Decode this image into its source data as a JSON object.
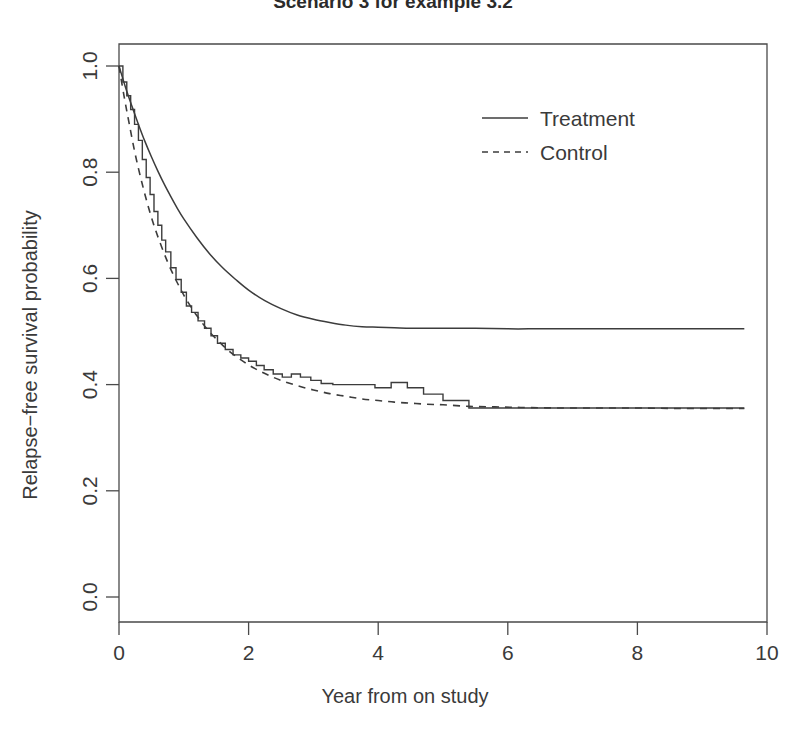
{
  "chart_data": {
    "type": "line",
    "title": "Scenario 3 for example 3.2",
    "xlabel": "Year from on study",
    "ylabel": "Relapse−free survival probability",
    "xlim": [
      0,
      10
    ],
    "ylim": [
      0.0,
      1.0
    ],
    "grid": false,
    "xticks": [
      0,
      2,
      4,
      6,
      8,
      10
    ],
    "xtick_labels": [
      "0",
      "2",
      "4",
      "6",
      "8",
      "10"
    ],
    "yticks": [
      0.0,
      0.2,
      0.4,
      0.6,
      0.8,
      1.0
    ],
    "ytick_labels": [
      "0.0",
      "0.2",
      "0.4",
      "0.6",
      "0.8",
      "1.0"
    ],
    "legend": {
      "position": "top-right",
      "entries": [
        {
          "label": "Treatment",
          "style": "solid"
        },
        {
          "label": "Control",
          "style": "dashed"
        }
      ]
    },
    "series": [
      {
        "name": "Treatment",
        "style": "solid",
        "kind": "smooth",
        "x": [
          0.0,
          0.1,
          0.2,
          0.3,
          0.4,
          0.5,
          0.6,
          0.7,
          0.8,
          0.9,
          1.0,
          1.2,
          1.4,
          1.6,
          1.8,
          2.0,
          2.25,
          2.5,
          2.75,
          3.0,
          3.25,
          3.5,
          3.75,
          4.0,
          4.25,
          4.5,
          4.75,
          5.0,
          5.5,
          6.0,
          6.5,
          7.0,
          7.5,
          8.0,
          8.5,
          9.0,
          9.5,
          9.65
        ],
        "y": [
          1.0,
          0.96,
          0.924,
          0.89,
          0.858,
          0.829,
          0.802,
          0.777,
          0.754,
          0.732,
          0.712,
          0.677,
          0.646,
          0.62,
          0.598,
          0.578,
          0.558,
          0.543,
          0.531,
          0.523,
          0.517,
          0.512,
          0.509,
          0.508,
          0.507,
          0.506,
          0.506,
          0.506,
          0.506,
          0.505,
          0.505,
          0.505,
          0.505,
          0.505,
          0.505,
          0.505,
          0.505,
          0.505
        ]
      },
      {
        "name": "Control",
        "style": "dashed",
        "kind": "smooth",
        "x": [
          0.0,
          0.08,
          0.16,
          0.25,
          0.35,
          0.45,
          0.55,
          0.65,
          0.75,
          0.85,
          0.95,
          1.05,
          1.2,
          1.35,
          1.5,
          1.7,
          1.9,
          2.1,
          2.3,
          2.5,
          2.75,
          3.0,
          3.25,
          3.5,
          3.75,
          4.0,
          4.25,
          4.5,
          4.75,
          5.0,
          5.4,
          5.8,
          6.2,
          6.8,
          7.4,
          8.0,
          8.6,
          9.2,
          9.65
        ],
        "y": [
          1.0,
          0.942,
          0.89,
          0.834,
          0.782,
          0.736,
          0.696,
          0.662,
          0.631,
          0.604,
          0.58,
          0.558,
          0.53,
          0.506,
          0.486,
          0.463,
          0.445,
          0.43,
          0.418,
          0.408,
          0.398,
          0.39,
          0.383,
          0.378,
          0.373,
          0.37,
          0.367,
          0.365,
          0.363,
          0.362,
          0.359,
          0.358,
          0.357,
          0.356,
          0.356,
          0.356,
          0.355,
          0.355,
          0.355
        ]
      },
      {
        "name": "Kaplan-Meier estimate",
        "style": "solid",
        "kind": "step",
        "x": [
          0.0,
          0.06,
          0.12,
          0.18,
          0.24,
          0.3,
          0.36,
          0.42,
          0.48,
          0.54,
          0.6,
          0.66,
          0.72,
          0.8,
          0.88,
          0.96,
          1.04,
          1.12,
          1.22,
          1.32,
          1.42,
          1.52,
          1.64,
          1.76,
          1.88,
          2.0,
          2.12,
          2.24,
          2.38,
          2.52,
          2.66,
          2.8,
          2.96,
          3.12,
          3.3,
          3.5,
          3.7,
          3.95,
          4.2,
          4.45,
          4.7,
          5.0,
          5.4,
          9.65
        ],
        "y": [
          1.0,
          0.97,
          0.944,
          0.918,
          0.89,
          0.86,
          0.824,
          0.79,
          0.758,
          0.726,
          0.7,
          0.672,
          0.65,
          0.62,
          0.598,
          0.574,
          0.548,
          0.536,
          0.52,
          0.506,
          0.492,
          0.478,
          0.466,
          0.456,
          0.45,
          0.444,
          0.436,
          0.428,
          0.42,
          0.414,
          0.42,
          0.414,
          0.408,
          0.402,
          0.4,
          0.4,
          0.4,
          0.394,
          0.404,
          0.394,
          0.382,
          0.37,
          0.356,
          0.356
        ]
      }
    ]
  },
  "geometry": {
    "plot_left": 119,
    "plot_right": 767,
    "plot_top": 44,
    "plot_bottom": 622,
    "y_unit_top": 66,
    "y_unit_bottom": 597
  }
}
